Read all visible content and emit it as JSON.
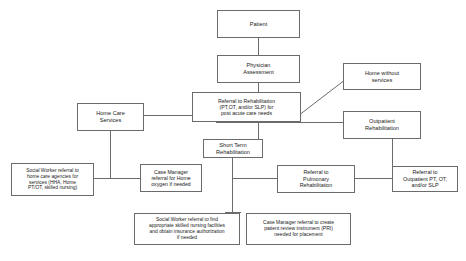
{
  "diagram": {
    "line_color": "#6b6b6b",
    "box_border_color": "#6b6b6b",
    "background_color": "#ffffff",
    "text_color": "#1a1a1a",
    "nodes": [
      {
        "id": "patient",
        "label": "Patient",
        "font_size": "5.6px"
      },
      {
        "id": "physician_assessment",
        "label": "Physician\nAssessment",
        "font_size": "5.6px"
      },
      {
        "id": "referral_rehab",
        "label": "Referral to Rehabilitation\n(PT,OT, and/or SLP) for\npost acute care needs",
        "font_size": "5.2px"
      },
      {
        "id": "home_without_services",
        "label": "Home without\nservices",
        "font_size": "5.6px"
      },
      {
        "id": "home_care_services",
        "label": "Home Care\nServices",
        "font_size": "5.6px"
      },
      {
        "id": "outpatient_rehab",
        "label": "Outpatient\nRehabilitation",
        "font_size": "5.6px"
      },
      {
        "id": "short_term_rehab",
        "label": "Short Term\nRehabilitation",
        "font_size": "5.6px"
      },
      {
        "id": "social_worker_home_care",
        "label": "Social Worker referral to\nhome care agencies for\nservices (HHA, Home\nPT/OT, skilled nursing)",
        "font_size": "4.9px"
      },
      {
        "id": "case_manager_oxygen",
        "label": "Case Manager\nreferral for Home\noxygen if needed",
        "font_size": "5.2px"
      },
      {
        "id": "referral_pulmonary",
        "label": "Referral to\nPulmonary\nRehabilitation",
        "font_size": "5.4px"
      },
      {
        "id": "referral_outpatient_pt",
        "label": "Referral to\nOutpatient PT, OT,\nand/or SLP",
        "font_size": "5.4px"
      },
      {
        "id": "social_worker_snf",
        "label": "Social Worker referral to find\nappropriate skilled nursing facilities\nand obtain insurance authorization\nif needed",
        "font_size": "4.9px"
      },
      {
        "id": "case_manager_pri",
        "label": "Case Manager referral to create\npatient review instrument (PRI)\nneeded for placement",
        "font_size": "5.0px"
      }
    ]
  }
}
